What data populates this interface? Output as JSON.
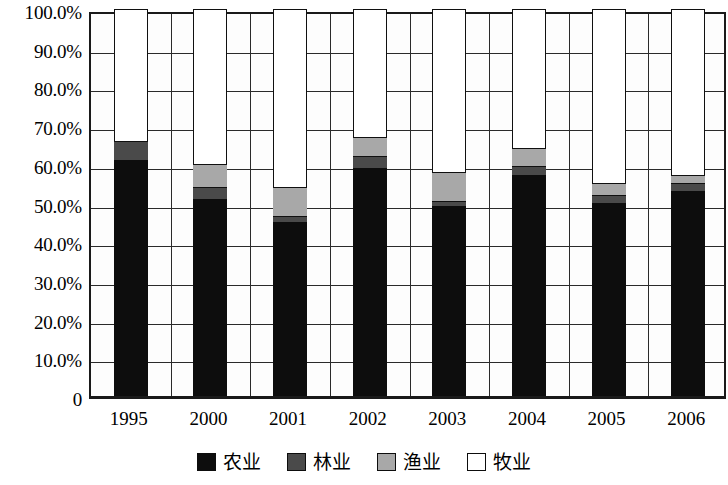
{
  "chart_data": {
    "type": "bar",
    "subtype": "stacked-percentage",
    "title": "",
    "subtitle": "",
    "xlabel": "",
    "ylabel": "",
    "categories": [
      "1995",
      "2000",
      "2001",
      "2002",
      "2003",
      "2004",
      "2005",
      "2006"
    ],
    "ylim": [
      0,
      100
    ],
    "yticks": [
      0,
      10,
      20,
      30,
      40,
      50,
      60,
      70,
      80,
      90,
      100
    ],
    "ytick_labels": [
      "0",
      "10.0%",
      "20.0%",
      "30.0%",
      "40.0%",
      "50.0%",
      "60.0%",
      "70.0%",
      "80.0%",
      "90.0%",
      "100.0%"
    ],
    "grid": true,
    "grid_axis": "both",
    "legend_position": "bottom",
    "series": [
      {
        "name": "农业",
        "color": "#0d0d0d",
        "values": [
          61.0,
          51.0,
          45.0,
          59.0,
          49.0,
          57.0,
          50.0,
          53.0
        ]
      },
      {
        "name": "林业",
        "color": "#4a4a4a",
        "values": [
          5.0,
          3.0,
          1.5,
          3.0,
          1.5,
          2.5,
          2.0,
          2.0
        ]
      },
      {
        "name": "渔业",
        "color": "#a8a8a8",
        "values": [
          0.0,
          6.0,
          7.5,
          5.0,
          7.5,
          4.5,
          3.0,
          2.0
        ]
      },
      {
        "name": "牧业",
        "color": "#ffffff",
        "values": [
          34.0,
          40.0,
          46.0,
          33.0,
          42.0,
          36.0,
          45.0,
          43.0
        ]
      }
    ]
  },
  "legend": {
    "items": [
      {
        "label": "农业",
        "color": "#0d0d0d"
      },
      {
        "label": "林业",
        "color": "#4a4a4a"
      },
      {
        "label": "渔业",
        "color": "#a8a8a8"
      },
      {
        "label": "牧业",
        "color": "#ffffff"
      }
    ]
  },
  "colors": {
    "axis": "#1a1a1a",
    "grid": "#2a2a2a",
    "background": "#ffffff"
  }
}
